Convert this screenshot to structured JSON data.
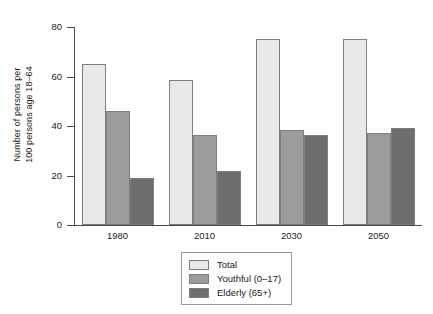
{
  "chart_data": {
    "type": "bar",
    "title": "",
    "xlabel": "",
    "ylabel_lines": [
      "Number of persons per",
      "100 persons age 18–64"
    ],
    "categories": [
      "1980",
      "2010",
      "2030",
      "2050"
    ],
    "series": [
      {
        "name": "Total",
        "color": "#e9e9e9",
        "values": [
          65,
          58.5,
          75,
          75
        ]
      },
      {
        "name": "Youthful (0–17)",
        "color": "#9c9c9c",
        "values": [
          46,
          36.5,
          38.5,
          37
        ]
      },
      {
        "name": "Elderly (65+)",
        "color": "#6e6e6e",
        "values": [
          19,
          22,
          36.5,
          39
        ]
      }
    ],
    "ylim": [
      0,
      80
    ],
    "yticks": [
      0,
      20,
      40,
      60,
      80
    ],
    "ytick_labels": [
      "0",
      "20",
      "40",
      "60",
      "80"
    ],
    "grid": false,
    "legend_position": "bottom-center",
    "bar_border_color": "#7d7d7d",
    "axis_color": "#4a4a4a"
  }
}
